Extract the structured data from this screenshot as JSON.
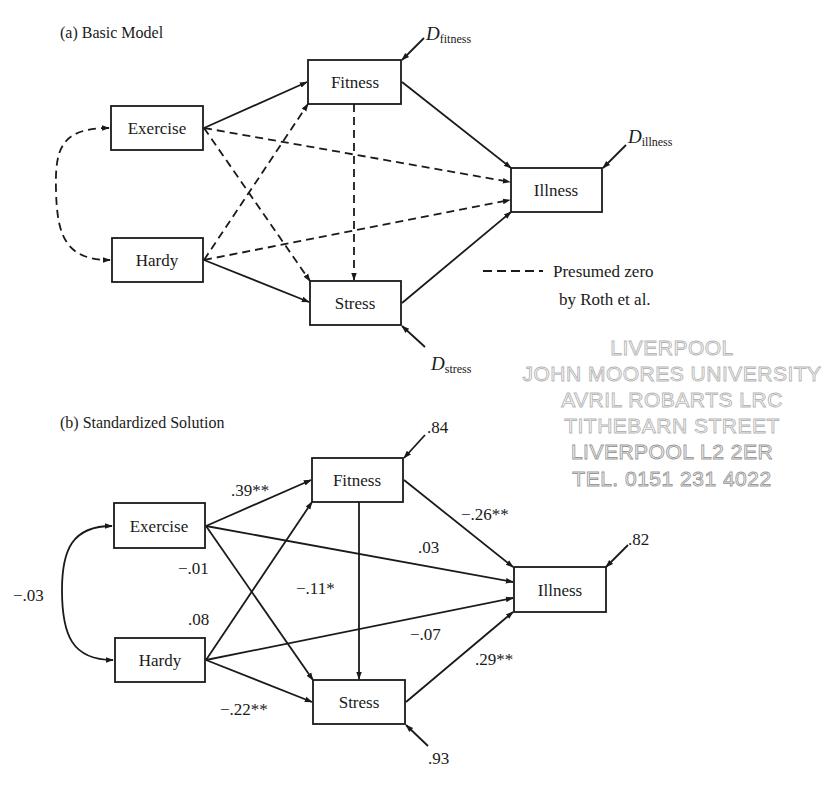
{
  "panel_a": {
    "title": "(a) Basic Model",
    "nodes": {
      "exercise": "Exercise",
      "hardy": "Hardy",
      "fitness": "Fitness",
      "stress": "Stress",
      "illness": "Illness"
    },
    "disturbances": {
      "fitness": {
        "symbol": "D",
        "sub": "fitness"
      },
      "illness": {
        "symbol": "D",
        "sub": "illness"
      },
      "stress": {
        "symbol": "D",
        "sub": "stress"
      }
    },
    "legend": {
      "line1": "Presumed zero",
      "line2": "by Roth et al."
    }
  },
  "panel_b": {
    "title": "(b) Standardized Solution",
    "nodes": {
      "exercise": "Exercise",
      "hardy": "Hardy",
      "fitness": "Fitness",
      "stress": "Stress",
      "illness": "Illness"
    },
    "coefficients": {
      "exercise_hardy": "−.03",
      "exercise_fitness": ".39**",
      "exercise_stress": "−.01",
      "exercise_illness": ".03",
      "hardy_fitness": ".08",
      "hardy_stress": "−.22**",
      "hardy_illness": "−.07",
      "fitness_stress": "−.11*",
      "fitness_illness": "−.26**",
      "stress_illness": ".29**"
    },
    "disturbances": {
      "fitness": ".84",
      "illness": ".82",
      "stress": ".93"
    }
  },
  "stamp": {
    "lines": [
      "LIVERPOOL",
      "JOHN MOORES UNIVERSITY",
      "AVRIL ROBARTS LRC",
      "TITHEBARN STREET",
      "LIVERPOOL L2 2ER",
      "TEL. 0151 231 4022"
    ]
  }
}
